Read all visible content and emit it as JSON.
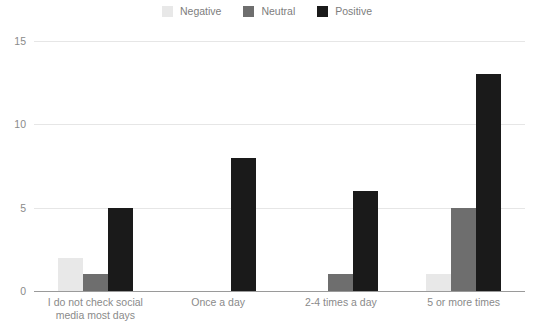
{
  "chart_data": {
    "type": "bar",
    "title": "",
    "xlabel": "",
    "ylabel": "",
    "ylim": [
      0,
      15
    ],
    "yticks": [
      0,
      5,
      10,
      15
    ],
    "grid": true,
    "legend_position": "top-center",
    "categories": [
      "I do not check social media most days",
      "Once a day",
      "2-4 times a day",
      "5 or more times"
    ],
    "category_lines": [
      [
        "I do not check social",
        "media most days"
      ],
      [
        "Once a day"
      ],
      [
        "2-4 times a day"
      ],
      [
        "5 or more times"
      ]
    ],
    "series": [
      {
        "name": "Negative",
        "color": "#e8e8e8",
        "values": [
          2,
          null,
          null,
          1
        ]
      },
      {
        "name": "Neutral",
        "color": "#6e6e6e",
        "values": [
          1,
          null,
          1,
          5
        ]
      },
      {
        "name": "Positive",
        "color": "#1a1a1a",
        "values": [
          5,
          8,
          6,
          13
        ]
      }
    ]
  },
  "legend": {
    "items": [
      {
        "label": "Negative",
        "color": "#e8e8e8"
      },
      {
        "label": "Neutral",
        "color": "#6e6e6e"
      },
      {
        "label": "Positive",
        "color": "#1a1a1a"
      }
    ]
  },
  "axis": {
    "y_tick_labels": [
      "15",
      "10",
      "5",
      "0"
    ]
  },
  "colors": {
    "gridline": "#e6e6e6",
    "axis_line": "#9a9a9a",
    "tick_text": "#8a8a8a",
    "background": "#ffffff"
  }
}
